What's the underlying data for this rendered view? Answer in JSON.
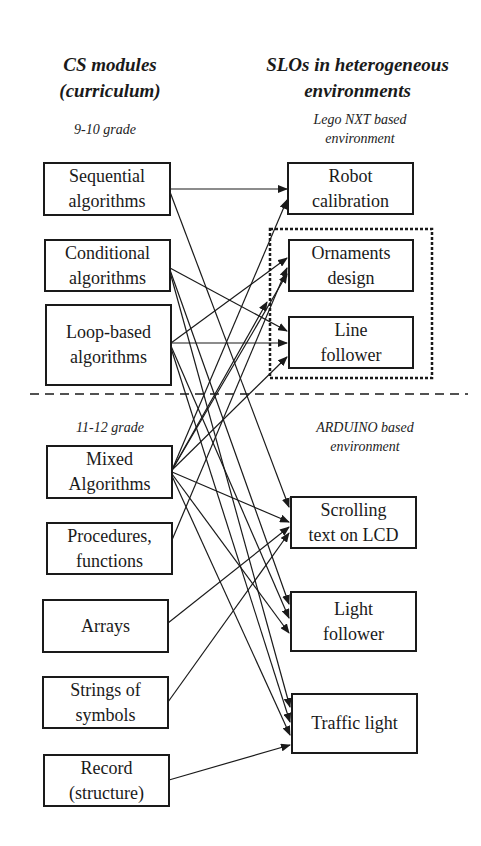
{
  "headers": {
    "left": "CS modules\n(curriculum)",
    "right": "SLOs in heterogeneous\nenvironments"
  },
  "sections": {
    "grade_9_10": "9-10 grade",
    "grade_11_12": "11-12 grade",
    "lego_env": "Lego NXT based\nenvironment",
    "arduino_env": "ARDUINO based\nenvironment"
  },
  "modules": [
    {
      "id": "seq",
      "label": "Sequential\nalgorithms"
    },
    {
      "id": "cond",
      "label": "Conditional\nalgorithms"
    },
    {
      "id": "loop",
      "label": "Loop-based\nalgorithms"
    },
    {
      "id": "mixed",
      "label": "Mixed\nAlgorithms"
    },
    {
      "id": "proc",
      "label": "Procedures,\nfunctions"
    },
    {
      "id": "arrays",
      "label": "Arrays"
    },
    {
      "id": "strings",
      "label": "Strings of\nsymbols"
    },
    {
      "id": "record",
      "label": "Record\n(structure)"
    }
  ],
  "outcomes": [
    {
      "id": "robot",
      "label": "Robot\ncalibration",
      "env": "lego"
    },
    {
      "id": "ornaments",
      "label": "Ornaments\ndesign",
      "env": "lego"
    },
    {
      "id": "linefollow",
      "label": "Line\nfollower",
      "env": "lego"
    },
    {
      "id": "scrolling",
      "label": "Scrolling\ntext on LCD",
      "env": "arduino"
    },
    {
      "id": "lightfollow",
      "label": "Light\nfollower",
      "env": "arduino"
    },
    {
      "id": "traffic",
      "label": "Traffic light",
      "env": "arduino"
    }
  ],
  "links": [
    {
      "from": "seq",
      "to": "robot"
    },
    {
      "from": "seq",
      "to": "scrolling"
    },
    {
      "from": "cond",
      "to": "linefollow"
    },
    {
      "from": "cond",
      "to": "lightfollow"
    },
    {
      "from": "cond",
      "to": "traffic"
    },
    {
      "from": "loop",
      "to": "ornaments"
    },
    {
      "from": "loop",
      "to": "linefollow"
    },
    {
      "from": "loop",
      "to": "lightfollow"
    },
    {
      "from": "loop",
      "to": "traffic"
    },
    {
      "from": "mixed",
      "to": "robot"
    },
    {
      "from": "mixed",
      "to": "ornaments"
    },
    {
      "from": "mixed",
      "to": "lego_group"
    },
    {
      "from": "mixed",
      "to": "linefollow"
    },
    {
      "from": "mixed",
      "to": "scrolling"
    },
    {
      "from": "mixed",
      "to": "lightfollow"
    },
    {
      "from": "mixed",
      "to": "traffic"
    },
    {
      "from": "proc",
      "to": "ornaments"
    },
    {
      "from": "arrays",
      "to": "scrolling"
    },
    {
      "from": "strings",
      "to": "scrolling"
    },
    {
      "from": "record",
      "to": "traffic"
    }
  ],
  "colors": {
    "line": "#1a1a1a",
    "background": "#ffffff"
  }
}
